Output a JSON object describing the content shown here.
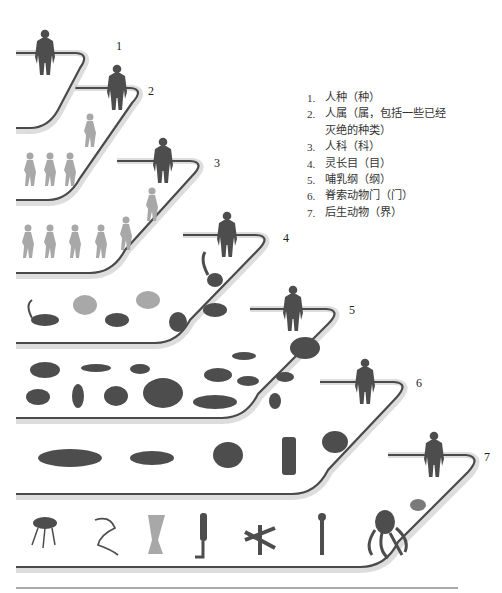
{
  "diagram": {
    "type": "taxonomy-staircase",
    "colors": {
      "line": "#4a4a4a",
      "shadow": "#9a9a9a",
      "silhouette_dark": "#4d4d4d",
      "silhouette_light": "#a8a8a8",
      "background": "#ffffff"
    }
  },
  "legend": {
    "items": [
      {
        "num": "1.",
        "text": "人种（种）"
      },
      {
        "num": "2.",
        "text": "人属（属，包括一些已经",
        "cont": "灭绝的种类）"
      },
      {
        "num": "3.",
        "text": "人科（科）"
      },
      {
        "num": "4.",
        "text": "灵长目（目）"
      },
      {
        "num": "5.",
        "text": "哺乳纲（纲）"
      },
      {
        "num": "6.",
        "text": "脊索动物门（门）"
      },
      {
        "num": "7.",
        "text": "后生动物（界）"
      }
    ]
  },
  "steps": [
    {
      "label": "1",
      "rank": "species",
      "contents": [
        "human"
      ]
    },
    {
      "label": "2",
      "rank": "genus",
      "contents": [
        "human",
        "early-hominin",
        "hominin",
        "hominin",
        "hominin"
      ]
    },
    {
      "label": "3",
      "rank": "family",
      "contents": [
        "human",
        "hominin",
        "hominin",
        "hominin",
        "hominin",
        "hominin",
        "ape"
      ]
    },
    {
      "label": "4",
      "rank": "order",
      "contents": [
        "human",
        "lemur",
        "monkey",
        "orangutan",
        "tarsier",
        "chimpanzee",
        "gorilla",
        "bushbaby"
      ]
    },
    {
      "label": "5",
      "rank": "class",
      "contents": [
        "human",
        "lion",
        "seal",
        "tortoise-like-mammal",
        "bat",
        "bison",
        "mammoth",
        "armadillo",
        "whale",
        "mouse",
        "aardvark",
        "kangaroo",
        "horse",
        "platypus",
        "rabbit"
      ]
    },
    {
      "label": "6",
      "rank": "phylum",
      "contents": [
        "human",
        "shark",
        "lizard",
        "ostrich",
        "tunicate",
        "frog"
      ]
    },
    {
      "label": "7",
      "rank": "kingdom",
      "contents": [
        "human",
        "jellyfish",
        "worm",
        "sponge",
        "tube-worm",
        "starfish",
        "hydroid",
        "octopus",
        "fly"
      ]
    }
  ]
}
